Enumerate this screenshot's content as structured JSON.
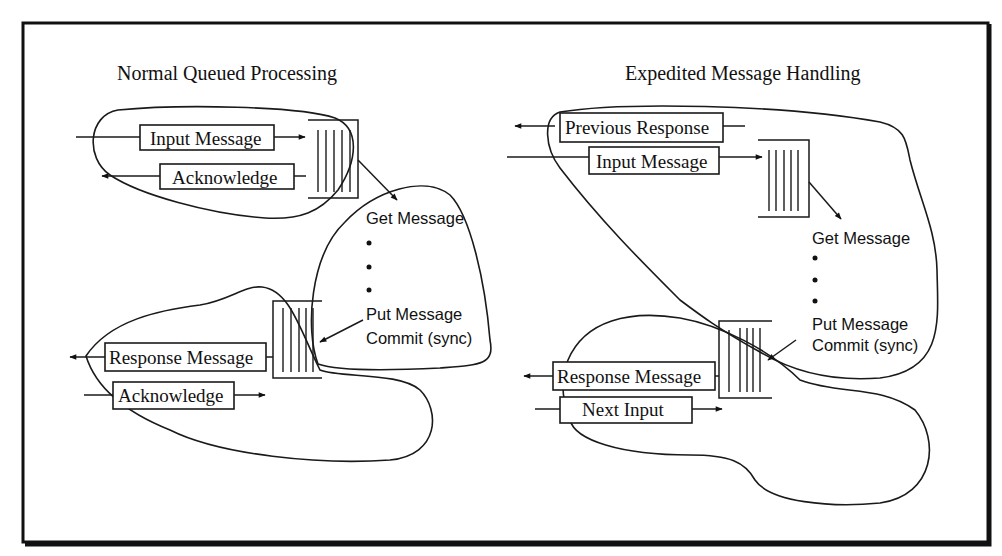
{
  "diagram": {
    "left_panel": {
      "title": "Normal Queued Processing",
      "top_group": {
        "input_label": "Input Message",
        "ack_label": "Acknowledge"
      },
      "process": {
        "get_label": "Get Message",
        "put_label": "Put Message",
        "commit_label": "Commit (sync)",
        "ellipsis_dots": 3
      },
      "bottom_group": {
        "response_label": "Response Message",
        "ack_label": "Acknowledge"
      }
    },
    "right_panel": {
      "title": "Expedited Message Handling",
      "top_group": {
        "previous_response_label": "Previous Response",
        "input_label": "Input Message"
      },
      "process": {
        "get_label": "Get Message",
        "put_label": "Put Message",
        "commit_label": "Commit (sync)",
        "ellipsis_dots": 3
      },
      "bottom_group": {
        "response_label": "Response Message",
        "next_input_label": "Next Input"
      }
    },
    "colors": {
      "ink": "#111111",
      "background": "#ffffff"
    }
  }
}
